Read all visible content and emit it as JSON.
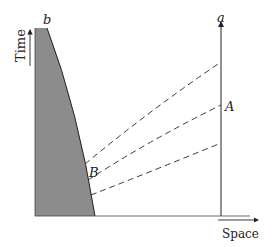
{
  "diagram": {
    "type": "spacetime-diagram",
    "axes": {
      "y_label": "Time",
      "x_label": "Space"
    },
    "labels": {
      "worldline_a": "a",
      "boundary_b": "b",
      "point_A": "A",
      "point_B": "B"
    },
    "colors": {
      "shaded_region": "#8c8c8c",
      "lines": "#222222",
      "background": "#ffffff"
    },
    "dashed_curve_count": 3
  }
}
